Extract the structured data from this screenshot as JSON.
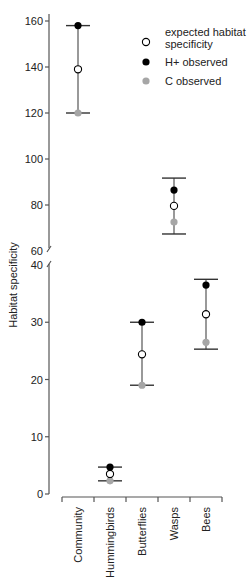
{
  "chart_data": {
    "type": "scatter",
    "subtype": "error-bar with broken y-axis",
    "title": "",
    "xlabel": "",
    "ylabel": "Habitat specificity",
    "categories": [
      "Community",
      "Hummingbirds",
      "Butterflies",
      "Wasps",
      "Bees"
    ],
    "y_axis_break": {
      "lower_range": [
        0,
        40
      ],
      "upper_range": [
        60,
        160
      ]
    },
    "yticks_lower": [
      0,
      10,
      20,
      30,
      40
    ],
    "yticks_upper": [
      60,
      80,
      100,
      120,
      140,
      160
    ],
    "series": [
      {
        "name": "expected habitat specificity",
        "marker": "open-circle",
        "color": "#000000",
        "values": [
          139,
          3.5,
          24.4,
          79.6,
          31.4
        ]
      },
      {
        "name": "H+ observed",
        "marker": "filled-circle",
        "color": "#000000",
        "values": [
          158,
          4.7,
          30,
          86.5,
          36.5
        ]
      },
      {
        "name": "C observed",
        "marker": "filled-circle",
        "color": "#a6a6a6",
        "values": [
          120,
          2.3,
          19,
          72.6,
          26.5
        ]
      }
    ],
    "error_bars": [
      {
        "category": "Community",
        "low": 120,
        "high": 158
      },
      {
        "category": "Hummingbirds",
        "low": 2.3,
        "high": 4.7
      },
      {
        "category": "Butterflies",
        "low": 19,
        "high": 30
      },
      {
        "category": "Wasps",
        "low": 67.4,
        "high": 91.7
      },
      {
        "category": "Bees",
        "low": 25.3,
        "high": 37.5
      }
    ],
    "legend": {
      "position": "top-right",
      "entries": [
        {
          "label_lines": [
            "expected habitat",
            "specificity"
          ],
          "marker": "open-circle",
          "color": "#000000"
        },
        {
          "label_lines": [
            "H+ observed"
          ],
          "marker": "filled-circle",
          "color": "#000000"
        },
        {
          "label_lines": [
            "C observed"
          ],
          "marker": "filled-circle",
          "color": "#a6a6a6"
        }
      ]
    },
    "grid": false
  }
}
